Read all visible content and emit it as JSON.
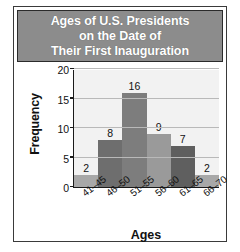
{
  "figure": {
    "title_lines": [
      "Ages of U.S. Presidents",
      "on the Date of",
      "Their First Inauguration"
    ],
    "title_background": "#8c8c8c",
    "title_color": "#ffffff"
  },
  "chart_data": {
    "type": "bar",
    "title": "Ages of U.S. Presidents on the Date of Their First Inauguration",
    "categories": [
      "41–45",
      "46–50",
      "51–55",
      "56–60",
      "61–65",
      "66–70"
    ],
    "values": [
      2,
      8,
      16,
      9,
      7,
      2
    ],
    "bar_colors": [
      "#a8a8a8",
      "#6e6e6e",
      "#7d7d7d",
      "#9a9a9a",
      "#5f5f5f",
      "#a8a8a8"
    ],
    "xlabel": "Ages",
    "ylabel": "Frequency",
    "ylim": [
      0,
      20
    ],
    "yticks": [
      0,
      5,
      10,
      15,
      20
    ],
    "ytick_labels": [
      "0",
      "5",
      "10",
      "15",
      "20"
    ],
    "data_labels": [
      "2",
      "8",
      "16",
      "9",
      "7",
      "2"
    ],
    "grid": true,
    "grid_axis": "y",
    "legend": false,
    "plot_background": "#f2f2f2",
    "gridline_color": "#b9b9b9",
    "axis_color": "#1a1a1a",
    "xtick_rotation": -38
  }
}
